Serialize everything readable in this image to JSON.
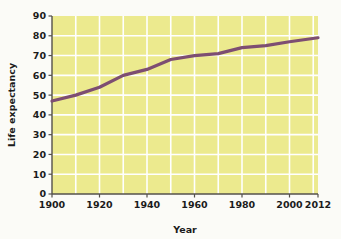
{
  "chart_data": {
    "type": "line",
    "title": "",
    "xlabel": "Year",
    "ylabel": "Life expectancy",
    "xlim": [
      1900,
      2012
    ],
    "ylim": [
      0,
      90
    ],
    "grid": true,
    "legend": false,
    "x_ticks": [
      "1900",
      "1920",
      "1940",
      "1960",
      "1980",
      "2000",
      "2012"
    ],
    "x_tick_values": [
      1900,
      1920,
      1940,
      1960,
      1980,
      2000,
      2012
    ],
    "y_ticks": [
      "0",
      "10",
      "20",
      "30",
      "40",
      "50",
      "60",
      "70",
      "80",
      "90"
    ],
    "y_tick_values": [
      0,
      10,
      20,
      30,
      40,
      50,
      60,
      70,
      80,
      90
    ],
    "x_gridline_values": [
      1910,
      1920,
      1930,
      1940,
      1950,
      1960,
      1970,
      1980,
      1990,
      2000,
      2010
    ],
    "y_gridline_values": [
      10,
      20,
      30,
      40,
      50,
      60,
      70,
      80
    ],
    "series": [
      {
        "name": "Life expectancy",
        "color": "#7d4e72",
        "x": [
          1900,
          1910,
          1920,
          1930,
          1940,
          1950,
          1960,
          1970,
          1980,
          1990,
          2000,
          2012
        ],
        "values": [
          47,
          50,
          54,
          60,
          63,
          68,
          70,
          71,
          74,
          75,
          77,
          79
        ]
      }
    ],
    "colors": {
      "plot_background": "#ecea8e",
      "gridlines": "#ffffff",
      "axis": "#54514b",
      "line": "#7d4e72",
      "page_background": "#fbfbf7",
      "text": "#1b1b1b"
    },
    "geometry": {
      "plot_left": 52,
      "plot_right": 318,
      "plot_top": 16,
      "plot_bottom": 194
    }
  }
}
